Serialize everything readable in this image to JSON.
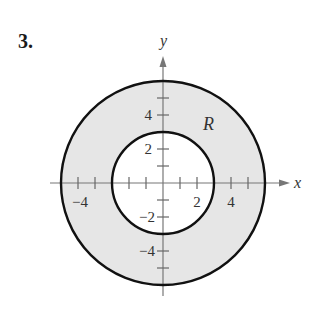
{
  "problem": {
    "number": "3."
  },
  "diagram": {
    "region_label": "R",
    "x_axis_label": "x",
    "y_axis_label": "y",
    "x_tick_labels": {
      "neg4": "−4",
      "pos2": "2",
      "pos4": "4"
    },
    "y_tick_labels": {
      "pos4": "4",
      "pos2": "2",
      "neg2": "−2",
      "neg4": "−4"
    },
    "outer_radius": 6,
    "inner_radius": 3,
    "colors": {
      "region_fill": "#e6e6e6",
      "circle_stroke": "#111111",
      "axis": "#777777"
    }
  }
}
